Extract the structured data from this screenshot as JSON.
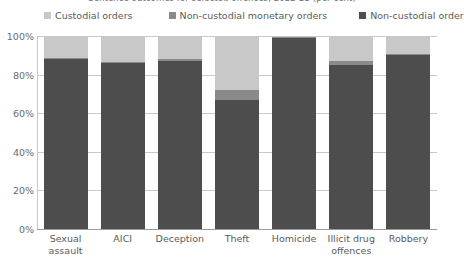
{
  "chart_data": {
    "type": "bar",
    "subtype": "stacked-100-percent",
    "title": "Sentence outcomes for selected offences, 2022-23 (per cent)",
    "xlabel": "",
    "ylabel": "",
    "ylim": [
      0,
      100
    ],
    "ytick_labels": [
      "0%",
      "20%",
      "40%",
      "60%",
      "80%",
      "100%"
    ],
    "ytick_values": [
      0,
      20,
      40,
      60,
      80,
      100
    ],
    "grid": true,
    "legend_position": "top",
    "categories": [
      "Sexual assault",
      "AICI",
      "Deception",
      "Theft",
      "Homicide",
      "Illicit drug offences",
      "Robbery"
    ],
    "category_lines": [
      [
        "Sexual",
        "assault"
      ],
      [
        "AICI"
      ],
      [
        "Deception"
      ],
      [
        "Theft"
      ],
      [
        "Homicide"
      ],
      [
        "Illicit drug",
        "offences"
      ],
      [
        "Robbery"
      ]
    ],
    "series": [
      {
        "name": "Non-custodial order",
        "color": "#4d4d4d",
        "values": [
          88,
          86,
          87,
          67,
          99,
          85,
          90
        ]
      },
      {
        "name": "Non-custodial monetary orders",
        "color": "#8a8a8a",
        "values": [
          0.5,
          0.5,
          1,
          5,
          0.5,
          2,
          0.5
        ]
      },
      {
        "name": "Custodial orders",
        "color": "#c8c8c8",
        "values": [
          11.5,
          13.5,
          12,
          28,
          0.5,
          13,
          9.5
        ]
      }
    ],
    "legend_order": [
      "Custodial orders",
      "Non-custodial monetary orders",
      "Non-custodial order"
    ],
    "colors": {
      "custodial_orders": "#c8c8c8",
      "non_custodial_monetary_orders": "#8a8a8a",
      "non_custodial_order": "#4d4d4d",
      "gridline": "#c9c9c9",
      "axis": "#9a9a9a",
      "text": "#5b5b5b",
      "background": "#ffffff"
    }
  }
}
